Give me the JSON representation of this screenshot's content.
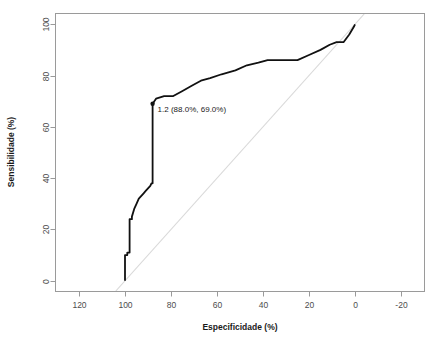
{
  "chart_data": {
    "type": "line",
    "title": "",
    "subtitle": "",
    "xlabel": "Especificidade (%)",
    "ylabel": "Sensibilidade (%)",
    "xlim": [
      130,
      -30
    ],
    "ylim": [
      -4,
      104
    ],
    "x_reversed": true,
    "grid": false,
    "legend": null,
    "legend_position": "none",
    "x_ticks": [
      120,
      100,
      80,
      60,
      40,
      20,
      0,
      -20
    ],
    "x_tick_labels": [
      "120",
      "100",
      "80",
      "60",
      "40",
      "20",
      "0",
      "-20"
    ],
    "y_ticks": [
      0,
      20,
      40,
      60,
      80,
      100
    ],
    "y_tick_labels": [
      "0",
      "20",
      "40",
      "60",
      "80",
      "100"
    ],
    "series": [
      {
        "name": "ROC curve",
        "color": "#111111",
        "x": [
          100.0,
          100.0,
          99.0,
          99.0,
          98.0,
          98.0,
          97.0,
          97.0,
          96.0,
          95.0,
          94.0,
          93.0,
          92.0,
          91.0,
          90.0,
          89.0,
          88.5,
          88.0,
          88.0,
          86.5,
          83.0,
          79.0,
          75.0,
          71.0,
          67.0,
          63.0,
          58.0,
          52.0,
          47.0,
          42.0,
          38.0,
          31.0,
          25.0,
          20.0,
          15.0,
          11.0,
          8.0,
          5.0,
          2.5,
          0.5,
          0.0
        ],
        "y": [
          0.0,
          10.0,
          10.0,
          11.0,
          11.0,
          24.0,
          24.0,
          25.0,
          28.0,
          30.0,
          32.0,
          33.0,
          34.0,
          35.0,
          36.0,
          37.0,
          38.0,
          38.0,
          69.0,
          71.0,
          72.0,
          72.0,
          74.0,
          76.0,
          78.0,
          79.0,
          80.5,
          82.0,
          84.0,
          85.0,
          86.0,
          86.0,
          86.0,
          88.0,
          90.0,
          92.0,
          93.0,
          93.0,
          96.0,
          99.0,
          100.0
        ]
      },
      {
        "name": "Reference diagonal",
        "color": "#d9d9d9",
        "x": [
          104.0,
          -4.0
        ],
        "y": [
          -4.0,
          104.0
        ]
      }
    ],
    "annotations": [
      {
        "name": "optimal-threshold",
        "label": "1.2 (88.0%, 69.0%)",
        "threshold": "1.2",
        "specificity": "88.0%",
        "sensitivity": "69.0%",
        "x": 88.0,
        "y": 69.0,
        "marker": "point"
      }
    ]
  }
}
